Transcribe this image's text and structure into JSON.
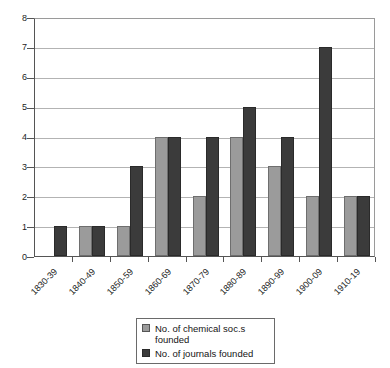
{
  "chart_data": {
    "type": "bar",
    "title": "",
    "subtitle": "",
    "xlabel": "",
    "ylabel": "",
    "ylim": [
      0,
      8
    ],
    "ytick_labels": [
      "0",
      "1",
      "2",
      "3",
      "4",
      "5",
      "6",
      "7",
      "8"
    ],
    "yticks": [
      0,
      1,
      2,
      3,
      4,
      5,
      6,
      7,
      8
    ],
    "grid": true,
    "legend_position": "bottom-center",
    "categories": [
      "1830-39",
      "1840-49",
      "1850-59",
      "1860-69",
      "1870-79",
      "1880-89",
      "1890-99",
      "1900-09",
      "1910-19"
    ],
    "series": [
      {
        "name": "No. of chemical soc.s founded",
        "color": "#9b9b9b",
        "values": [
          0,
          1,
          1,
          4,
          2,
          4,
          3,
          2,
          2
        ]
      },
      {
        "name": "No. of journals founded",
        "color": "#3b3b3b",
        "values": [
          1,
          1,
          3,
          4,
          4,
          5,
          4,
          7,
          2
        ]
      }
    ]
  },
  "legend": {
    "entries": [
      {
        "label": "No. of chemical soc.s founded",
        "swatch": "gray-swatch-icon"
      },
      {
        "label": "No. of journals founded",
        "swatch": "dark-swatch-icon"
      }
    ]
  }
}
